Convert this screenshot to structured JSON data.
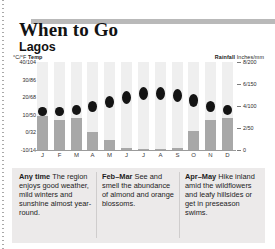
{
  "header": {
    "title": "When to Go",
    "subtitle": "Lagos"
  },
  "axes": {
    "temp_label_bold": "Temp",
    "temp_label_units": "°C/°F",
    "rain_label_bold": "Rainfall",
    "rain_label_units": "Inches/mm"
  },
  "chart_data": {
    "type": "bar",
    "subtitle": "Lagos",
    "xlabel": "",
    "ylabel": "°C/°F Temp",
    "y2label": "Rainfall Inches/mm",
    "grid": true,
    "legend": "none",
    "categories": [
      "J",
      "F",
      "M",
      "A",
      "M",
      "J",
      "J",
      "A",
      "S",
      "O",
      "N",
      "D"
    ],
    "left_axis": {
      "ticks": [
        "40/104",
        "30/86",
        "20/68",
        "10/50",
        "0/32",
        "-10/14"
      ],
      "values_c": [
        40,
        30,
        20,
        10,
        0,
        -10
      ],
      "values_f": [
        104,
        86,
        68,
        50,
        32,
        14
      ],
      "ylim": [
        -10,
        40
      ]
    },
    "right_axis": {
      "ticks": [
        "8/200",
        "6/150",
        "4/100",
        "2/50",
        "0"
      ],
      "values_in": [
        8,
        6,
        4,
        2,
        0
      ],
      "values_mm": [
        200,
        150,
        100,
        50,
        0
      ],
      "ylim": [
        0,
        200
      ]
    },
    "series": [
      {
        "name": "Rainfall",
        "type": "bar",
        "unit": "inches",
        "values": [
          3.1,
          2.7,
          2.9,
          1.6,
          0.9,
          0.2,
          0.1,
          0.1,
          0.2,
          1.7,
          2.7,
          2.9
        ]
      },
      {
        "name": "Temperature",
        "type": "marker",
        "unit": "°C",
        "values": [
          12,
          12,
          13,
          15,
          17,
          20,
          22,
          22,
          21,
          18,
          15,
          13
        ]
      }
    ]
  },
  "notes": [
    {
      "heading": "Any time",
      "text": " The region enjoys good weather, mild winters and sunshine almost year-round."
    },
    {
      "heading": "Feb–Mar",
      "text": " See and smell the abundance of almond and orange blossoms."
    },
    {
      "heading": "Apr–May",
      "text": " Hike inland amid the wildflowers and leafy hillsides or get in preseason swims."
    }
  ]
}
